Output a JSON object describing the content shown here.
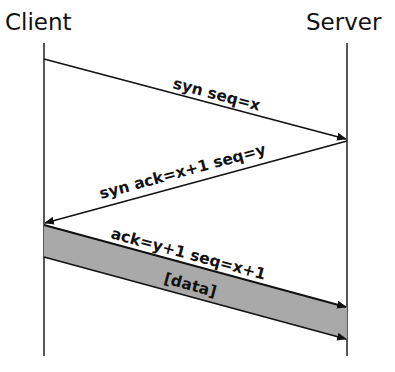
{
  "diagram": {
    "type": "sequence",
    "participants": [
      {
        "id": "client",
        "label": "Client"
      },
      {
        "id": "server",
        "label": "Server"
      }
    ],
    "messages": [
      {
        "from": "client",
        "to": "server",
        "label": "syn seq=x"
      },
      {
        "from": "server",
        "to": "client",
        "label": "syn ack=x+1 seq=y"
      },
      {
        "from": "client",
        "to": "server",
        "label": "ack=y+1 seq=x+1"
      },
      {
        "from": "client",
        "to": "server",
        "label": "[data]"
      }
    ],
    "colors": {
      "line": "#111111",
      "data_band": "#a9a9a9",
      "background": "#ffffff"
    }
  }
}
